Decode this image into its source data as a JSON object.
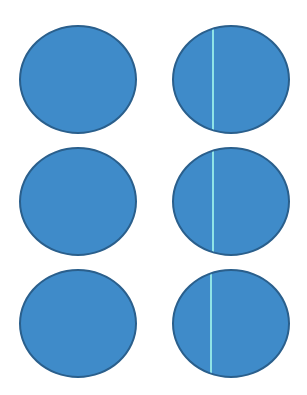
{
  "colors": {
    "fill": "#3f8bc9",
    "border": "#2a5f8c",
    "divider": "#8fe3e6",
    "background": "#ffffff"
  },
  "circles": [
    {
      "id": "row1-left",
      "x": 19,
      "y": 25,
      "w": 118,
      "h": 109,
      "divider": false
    },
    {
      "id": "row1-right",
      "x": 172,
      "y": 25,
      "w": 118,
      "h": 109,
      "divider": true,
      "divider_x": 38
    },
    {
      "id": "row2-left",
      "x": 19,
      "y": 147,
      "w": 118,
      "h": 109,
      "divider": false
    },
    {
      "id": "row2-right",
      "x": 172,
      "y": 147,
      "w": 118,
      "h": 109,
      "divider": true,
      "divider_x": 38
    },
    {
      "id": "row3-left",
      "x": 19,
      "y": 269,
      "w": 118,
      "h": 109,
      "divider": false
    },
    {
      "id": "row3-right",
      "x": 172,
      "y": 269,
      "w": 118,
      "h": 109,
      "divider": true,
      "divider_x": 36
    }
  ]
}
